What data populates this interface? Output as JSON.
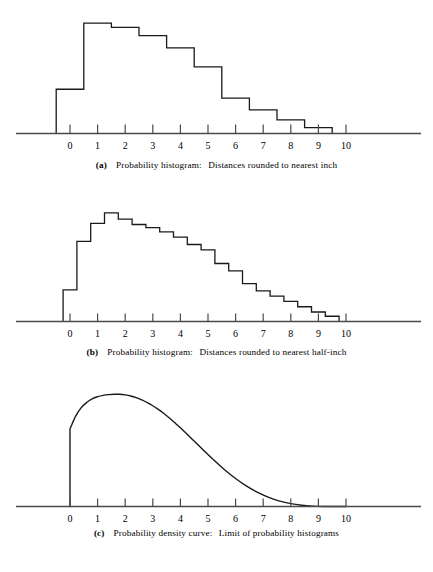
{
  "figure": {
    "axis_color": "#4a4a4a",
    "bar_color": "#1a1a1a",
    "curve_color": "#1a1a1a",
    "background": "#ffffff"
  },
  "panels": {
    "a": {
      "tag": "(a)",
      "caption": "Probability histogram:  Distances rounded to nearest inch",
      "caption_part1": "Probability histogram:",
      "caption_part2": "Distances rounded to nearest inch",
      "tick_labels": [
        "0",
        "1",
        "2",
        "3",
        "4",
        "5",
        "6",
        "7",
        "8",
        "9",
        "10"
      ]
    },
    "b": {
      "tag": "(b)",
      "caption": "Probability histogram:  Distances rounded to nearest half-inch",
      "caption_part1": "Probability histogram:",
      "caption_part2": "Distances rounded to nearest half-inch",
      "tick_labels": [
        "0",
        "1",
        "2",
        "3",
        "4",
        "5",
        "6",
        "7",
        "8",
        "9",
        "10"
      ]
    },
    "c": {
      "tag": "(c)",
      "caption": "Probability density curve:  Limit of probability histograms",
      "caption_part1": "Probability density curve:",
      "caption_part2": "Limit of probability histograms",
      "tick_labels": [
        "0",
        "1",
        "2",
        "3",
        "4",
        "5",
        "6",
        "7",
        "8",
        "9",
        "10"
      ]
    }
  },
  "chart_data": [
    {
      "id": "histogram-nearest-inch",
      "type": "bar",
      "title": "Probability histogram: Distances rounded to nearest inch",
      "xlabel": "",
      "ylabel": "",
      "xlim": [
        -1.2,
        11.2
      ],
      "ylim": [
        0,
        0.2
      ],
      "grid": false,
      "legend": null,
      "bin_width": 1,
      "categories": [
        "0",
        "1",
        "2",
        "3",
        "4",
        "5",
        "6",
        "7",
        "8",
        "9",
        "10"
      ],
      "bin_edges": [
        -0.5,
        0.5,
        1.5,
        2.5,
        3.5,
        4.5,
        5.5,
        6.5,
        7.5,
        8.5,
        9.5,
        10.5
      ],
      "values": [
        0.075,
        0.187,
        0.18,
        0.166,
        0.145,
        0.113,
        0.06,
        0.04,
        0.023,
        0.01,
        0.0
      ],
      "tick_positions": [
        0,
        1,
        2,
        3,
        4,
        5,
        6,
        7,
        8,
        9,
        10
      ],
      "tick_labels": [
        "0",
        "1",
        "2",
        "3",
        "4",
        "5",
        "6",
        "7",
        "8",
        "9",
        "10"
      ]
    },
    {
      "id": "histogram-nearest-half-inch",
      "type": "bar",
      "title": "Probability histogram: Distances rounded to nearest half-inch",
      "xlabel": "",
      "ylabel": "",
      "xlim": [
        -1.2,
        11.2
      ],
      "ylim": [
        0,
        0.11
      ],
      "grid": false,
      "legend": null,
      "bin_width": 0.5,
      "categories": [
        "0.0",
        "0.5",
        "1.0",
        "1.5",
        "2.0",
        "2.5",
        "3.0",
        "3.5",
        "4.0",
        "4.5",
        "5.0",
        "5.5",
        "6.0",
        "6.5",
        "7.0",
        "7.5",
        "8.0",
        "8.5",
        "9.0",
        "9.5"
      ],
      "bin_edges": [
        -0.25,
        0.25,
        0.75,
        1.25,
        1.75,
        2.25,
        2.75,
        3.25,
        3.75,
        4.25,
        4.75,
        5.25,
        5.75,
        6.25,
        6.75,
        7.25,
        7.75,
        8.25,
        8.75,
        9.25,
        9.75
      ],
      "values": [
        0.03,
        0.076,
        0.093,
        0.103,
        0.097,
        0.092,
        0.089,
        0.085,
        0.08,
        0.073,
        0.068,
        0.055,
        0.048,
        0.036,
        0.029,
        0.024,
        0.019,
        0.014,
        0.009,
        0.005
      ],
      "tick_positions": [
        0,
        1,
        2,
        3,
        4,
        5,
        6,
        7,
        8,
        9,
        10
      ],
      "tick_labels": [
        "0",
        "1",
        "2",
        "3",
        "4",
        "5",
        "6",
        "7",
        "8",
        "9",
        "10"
      ]
    },
    {
      "id": "probability-density-curve",
      "type": "line",
      "title": "Probability density curve: Limit of probability histograms",
      "xlabel": "",
      "ylabel": "",
      "xlim": [
        -1.2,
        11.2
      ],
      "ylim": [
        0,
        0.115
      ],
      "grid": false,
      "legend": null,
      "note": "Density is 0 for x<0; jumps vertically at x=0 to about 0.073, peaks near x=1.8 at about 0.105, then decays to ~0 by x=9.3",
      "x": [
        0,
        0.2,
        0.4,
        0.6,
        0.8,
        1.0,
        1.2,
        1.4,
        1.6,
        1.8,
        2.0,
        2.2,
        2.4,
        2.6,
        2.8,
        3.0,
        3.2,
        3.4,
        3.6,
        3.8,
        4.0,
        4.4,
        4.8,
        5.2,
        5.6,
        6.0,
        6.4,
        6.8,
        7.2,
        7.6,
        8.0,
        8.4,
        8.8,
        9.0,
        9.2,
        9.3,
        10.0
      ],
      "y": [
        0.073,
        0.085,
        0.093,
        0.098,
        0.1015,
        0.1035,
        0.1048,
        0.1055,
        0.1058,
        0.1058,
        0.1052,
        0.1042,
        0.1026,
        0.1005,
        0.098,
        0.095,
        0.0915,
        0.0876,
        0.0834,
        0.0789,
        0.0742,
        0.0642,
        0.054,
        0.044,
        0.0347,
        0.0264,
        0.0192,
        0.0133,
        0.0086,
        0.0051,
        0.0027,
        0.0012,
        0.0003,
        0.0001,
        0.0,
        0.0,
        0.0
      ],
      "tick_positions": [
        0,
        1,
        2,
        3,
        4,
        5,
        6,
        7,
        8,
        9,
        10
      ],
      "tick_labels": [
        "0",
        "1",
        "2",
        "3",
        "4",
        "5",
        "6",
        "7",
        "8",
        "9",
        "10"
      ]
    }
  ]
}
